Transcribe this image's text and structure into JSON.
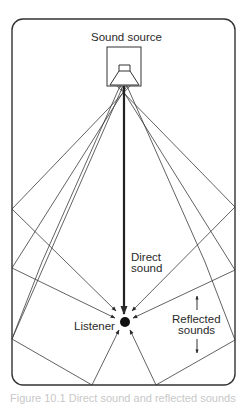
{
  "diagram": {
    "labels": {
      "source": "Sound source",
      "direct_line1": "Direct",
      "direct_line2": "sound",
      "listener": "Listener",
      "reflected_line1": "Reflected",
      "reflected_line2": "sounds"
    },
    "caption": "Figure 10.1  Direct sound and reflected sounds",
    "colors": {
      "stroke": "#333333",
      "background": "#ffffff"
    }
  }
}
